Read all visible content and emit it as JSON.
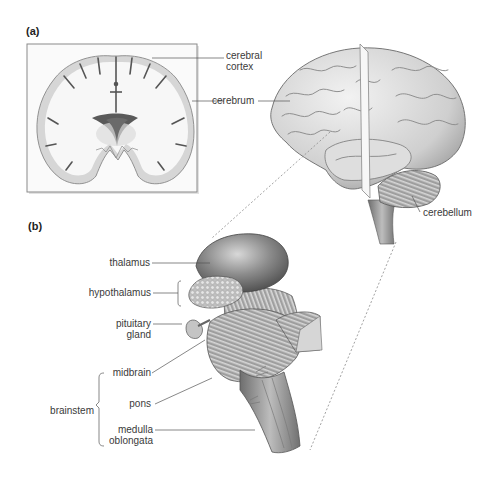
{
  "panels": {
    "a": {
      "label": "(a)",
      "labels": {
        "cerebral_cortex_1": "cerebral",
        "cerebral_cortex_2": "cortex",
        "cerebrum": "cerebrum",
        "cerebellum": "cerebellum"
      }
    },
    "b": {
      "label": "(b)",
      "labels": {
        "thalamus": "thalamus",
        "hypothalamus": "hypothalamus",
        "pituitary_1": "pituitary",
        "pituitary_2": "gland",
        "midbrain": "midbrain",
        "pons": "pons",
        "medulla_1": "medulla",
        "medulla_2": "oblongata",
        "brainstem": "brainstem"
      }
    }
  },
  "colors": {
    "background": "#ffffff",
    "tissue_light": "#f4f4f4",
    "cortex_gray": "#d4d4d4",
    "brain_mid": "#bdbdbd",
    "brain_dark": "#6a6a6a",
    "leader_line": "#555555"
  }
}
